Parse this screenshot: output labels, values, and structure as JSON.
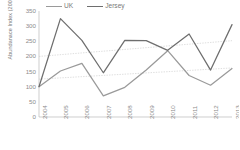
{
  "chart_data": {
    "type": "line",
    "title": "",
    "xlabel": "",
    "ylabel": "Abundanace Index (2004=100)",
    "categories": [
      "2004",
      "2005",
      "2006",
      "2007",
      "2008",
      "2009",
      "2010",
      "2011",
      "2012",
      "2013"
    ],
    "series": [
      {
        "name": "UK",
        "color": "#9a9a9a",
        "values": [
          100,
          152,
          177,
          70,
          98,
          155,
          219,
          137,
          105,
          160
        ]
      },
      {
        "name": "Jersey",
        "color": "#6e6e6e",
        "values": [
          100,
          325,
          253,
          146,
          253,
          252,
          220,
          274,
          155,
          305
        ]
      }
    ],
    "trendlines": [
      {
        "name": "Jersey trend",
        "color": "#c8c8c8",
        "start": 200,
        "end": 252,
        "style": "dotted"
      },
      {
        "name": "UK trend",
        "color": "#c8c8c8",
        "start": 125,
        "end": 162,
        "style": "dotted"
      }
    ],
    "yticks": [
      350,
      300,
      250,
      200,
      150,
      100,
      50,
      0
    ],
    "ylim": [
      0,
      350
    ],
    "grid": false,
    "legend_position": "top"
  },
  "legend": {
    "items": [
      {
        "label": "UK"
      },
      {
        "label": "Jersey"
      }
    ]
  }
}
